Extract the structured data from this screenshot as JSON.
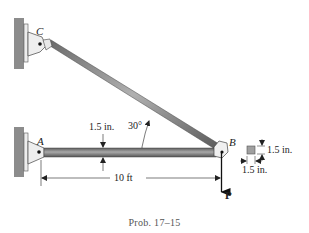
{
  "figure": {
    "caption": "Prob. 17–15",
    "points": {
      "A": "A",
      "B": "B",
      "C": "C"
    },
    "load_label": "P",
    "angle_label": "30°",
    "bar_thickness_label": "1.5 in.",
    "bar_length_label": "10 ft",
    "section_height_label": "1.5 in.",
    "section_width_label": "1.5 in.",
    "colors": {
      "wall": "#8c8c8c",
      "bar": "#7a7a7a",
      "bar_highlight": "#b5b5b5",
      "bracket": "#e6e6e6",
      "line": "#222222",
      "section": "#a0a0a0"
    }
  }
}
